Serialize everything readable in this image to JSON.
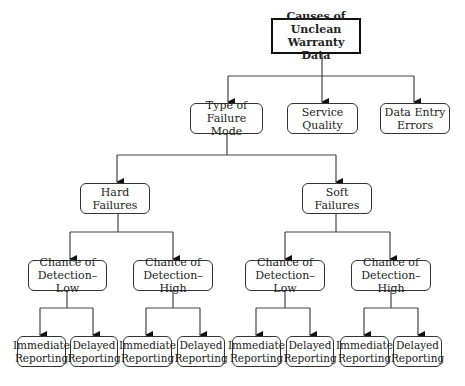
{
  "root": {
    "label": "Causes of Unclean\nWarranty Data"
  },
  "level1": [
    {
      "label": "Type of\nFailure Mode"
    },
    {
      "label": "Service\nQuality"
    },
    {
      "label": "Data Entry\nErrors"
    }
  ],
  "level2": [
    {
      "label": "Hard Failures"
    },
    {
      "label": "Soft Failures"
    }
  ],
  "level3": [
    {
      "label": "Chance of\nDetection–Low"
    },
    {
      "label": "Chance of\nDetection–High"
    },
    {
      "label": "Chance of\nDetection–Low"
    },
    {
      "label": "Chance of\nDetection–High"
    }
  ],
  "level4": [
    {
      "label": "Immediate\nReporting"
    },
    {
      "label": "Delayed\nReporting"
    },
    {
      "label": "Immediate\nReporting"
    },
    {
      "label": "Delayed\nReporting"
    },
    {
      "label": "Immediate\nReporting"
    },
    {
      "label": "Delayed\nReporting"
    },
    {
      "label": "Immediate\nReporting"
    },
    {
      "label": "Delayed\nReporting"
    }
  ]
}
